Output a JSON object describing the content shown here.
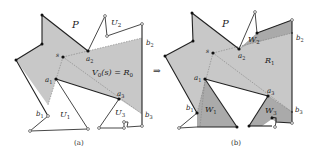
{
  "figure": {
    "colors": {
      "region_fill": "#c8c8c8",
      "region_dark": "#a9a9a9",
      "edge": "#222222",
      "dashed": "#8a8a8a"
    },
    "arrow": "⇒",
    "panel_a": {
      "caption": "(a)",
      "labels": {
        "P": "P",
        "s": "s",
        "a1": "a",
        "a1_sub": "1",
        "a2": "a",
        "a2_sub": "2",
        "a3": "a",
        "a3_sub": "3",
        "b1": "b",
        "b1_sub": "1",
        "b2": "b",
        "b2_sub": "2",
        "b3": "b",
        "b3_sub": "3",
        "U1": "U",
        "U1_sub": "1",
        "U2": "U",
        "U2_sub": "2",
        "U3": "U",
        "U3_sub": "3",
        "region": "V",
        "region_sub": "0",
        "region_rest": "(s) = R",
        "region_rest_sub": "0"
      }
    },
    "panel_b": {
      "caption": "(b)",
      "labels": {
        "P": "P",
        "s": "s",
        "a1": "a",
        "a1_sub": "1",
        "a2": "a",
        "a2_sub": "2",
        "a3": "a",
        "a3_sub": "3",
        "b1": "b",
        "b1_sub": "1",
        "b2": "b",
        "b2_sub": "2",
        "b3": "b",
        "b3_sub": "3",
        "W1": "W",
        "W1_sub": "1",
        "W2": "W",
        "W2_sub": "2",
        "W3": "W",
        "W3_sub": "3",
        "R1": "R",
        "R1_sub": "1"
      }
    }
  }
}
